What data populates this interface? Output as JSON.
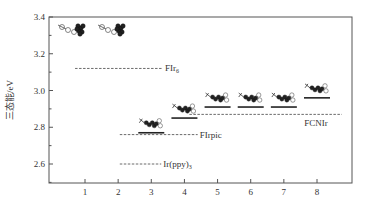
{
  "chart_data": {
    "type": "line",
    "title": "",
    "xlabel": "",
    "ylabel": "三态能/eV",
    "xlim": [
      0,
      9
    ],
    "ylim": [
      2.5,
      3.4
    ],
    "x_ticks": [
      "1",
      "2",
      "3",
      "4",
      "5",
      "6",
      "7",
      "8"
    ],
    "y_ticks": [
      "2.6",
      "2.8",
      "3.0",
      "3.2",
      "3.4"
    ],
    "grid": false,
    "reference_levels": [
      {
        "name": "FIr6",
        "label": "FIr",
        "subscript": "6",
        "value": 3.12,
        "x_start": 0.7,
        "x_end": 3.35
      },
      {
        "name": "FCNIr",
        "label": "FCNIr",
        "subscript": "",
        "value": 2.87,
        "x_start": 4.15,
        "x_end": 8.75
      },
      {
        "name": "FIrpic",
        "label": "FIrpic",
        "subscript": "",
        "value": 2.76,
        "x_start": 2.05,
        "x_end": 4.4
      },
      {
        "name": "Ir(ppy)3",
        "label": "Ir(ppy)",
        "subscript": "3",
        "value": 2.6,
        "x_start": 2.05,
        "x_end": 3.3
      }
    ],
    "compound_levels": [
      {
        "x": 3,
        "value": 2.77
      },
      {
        "x": 4,
        "value": 2.85
      },
      {
        "x": 5,
        "value": 2.91
      },
      {
        "x": 6,
        "value": 2.91
      },
      {
        "x": 7,
        "value": 2.91
      },
      {
        "x": 8,
        "value": 2.96
      }
    ],
    "annotations": [
      "molecular structure drawings above compounds 1–8"
    ]
  }
}
